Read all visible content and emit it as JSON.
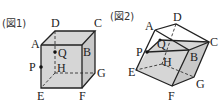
{
  "figures": [
    {
      "caption": "(図1)",
      "vertex_labels": {
        "A": "A",
        "B": "B",
        "C": "C",
        "D": "D",
        "E": "E",
        "F": "F",
        "G": "G",
        "H": "H",
        "P": "P",
        "Q": "Q"
      }
    },
    {
      "caption": "(図2)",
      "vertex_labels": {
        "A": "A",
        "B": "B",
        "C": "C",
        "D": "D",
        "E": "E",
        "F": "F",
        "G": "G",
        "H": "H",
        "P": "P",
        "Q": "Q"
      }
    }
  ],
  "colors": {
    "line": "#222222",
    "shade": "#d6d6d6"
  }
}
